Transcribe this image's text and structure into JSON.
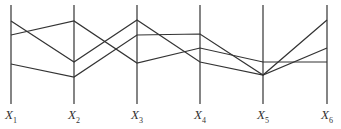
{
  "diagram": {
    "type": "parallel-coordinates",
    "axes": [
      {
        "label": "X",
        "sub": "1",
        "x": 11
      },
      {
        "label": "X",
        "sub": "2",
        "x": 74
      },
      {
        "label": "X",
        "sub": "3",
        "x": 137
      },
      {
        "label": "X",
        "sub": "4",
        "x": 200
      },
      {
        "label": "X",
        "sub": "5",
        "x": 263
      },
      {
        "label": "X",
        "sub": "6",
        "x": 327
      }
    ],
    "axis_top": 5,
    "axis_bottom": 104,
    "polylines": [
      [
        21,
        62,
        20,
        62,
        75,
        20
      ],
      [
        35,
        21,
        63,
        48,
        62,
        62
      ],
      [
        64,
        77,
        35,
        34,
        75,
        48
      ]
    ],
    "stroke_color": "#333333"
  }
}
